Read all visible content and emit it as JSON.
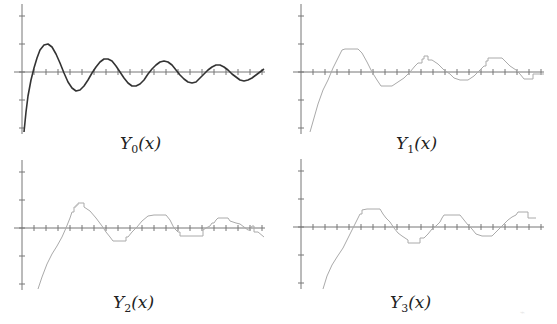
{
  "chart_data": [
    {
      "type": "line",
      "title": "Y_0(x)",
      "caption": {
        "base": "Y",
        "sub": "0",
        "arg": "(x)"
      },
      "style": "smooth",
      "color": "#333333",
      "axes": {
        "origin_px": [
          22,
          72
        ],
        "y_ticks_px": [
          16,
          44,
          72,
          100,
          128
        ],
        "x_tick_step_px": 12,
        "x_range_px": [
          14,
          265
        ],
        "y_range_px": [
          4,
          134
        ]
      },
      "grid": false,
      "points": [
        [
          24,
          132
        ],
        [
          26,
          112
        ],
        [
          28,
          96
        ],
        [
          31,
          80
        ],
        [
          34,
          68
        ],
        [
          37,
          58
        ],
        [
          40,
          50
        ],
        [
          44,
          45
        ],
        [
          48,
          44
        ],
        [
          52,
          47
        ],
        [
          56,
          54
        ],
        [
          60,
          63
        ],
        [
          64,
          73
        ],
        [
          68,
          82
        ],
        [
          72,
          88
        ],
        [
          76,
          91
        ],
        [
          80,
          90
        ],
        [
          84,
          86
        ],
        [
          88,
          80
        ],
        [
          92,
          73
        ],
        [
          96,
          67
        ],
        [
          100,
          62
        ],
        [
          104,
          59
        ],
        [
          108,
          59
        ],
        [
          112,
          61
        ],
        [
          116,
          66
        ],
        [
          120,
          72
        ],
        [
          124,
          78
        ],
        [
          128,
          83
        ],
        [
          132,
          86
        ],
        [
          136,
          86
        ],
        [
          140,
          84
        ],
        [
          144,
          80
        ],
        [
          148,
          74
        ],
        [
          152,
          69
        ],
        [
          156,
          65
        ],
        [
          160,
          62
        ],
        [
          164,
          61
        ],
        [
          168,
          62
        ],
        [
          172,
          65
        ],
        [
          176,
          70
        ],
        [
          180,
          75
        ],
        [
          184,
          79
        ],
        [
          188,
          82
        ],
        [
          192,
          83
        ],
        [
          196,
          82
        ],
        [
          200,
          78
        ],
        [
          204,
          74
        ],
        [
          208,
          70
        ],
        [
          212,
          67
        ],
        [
          216,
          65
        ],
        [
          220,
          65
        ],
        [
          224,
          67
        ],
        [
          228,
          70
        ],
        [
          232,
          74
        ],
        [
          236,
          77
        ],
        [
          240,
          80
        ],
        [
          244,
          81
        ],
        [
          248,
          80
        ],
        [
          252,
          78
        ],
        [
          256,
          75
        ],
        [
          260,
          72
        ],
        [
          264,
          69
        ]
      ]
    },
    {
      "type": "line",
      "title": "Y_1(x)",
      "caption": {
        "base": "Y",
        "sub": "1",
        "arg": "(x)"
      },
      "style": "stepped-approximation",
      "color": "#aaaaaa",
      "axes": {
        "origin_px": [
          301,
          72
        ],
        "y_ticks_px": [
          16,
          44,
          72,
          100,
          128
        ],
        "x_tick_step_px": 12,
        "x_range_px": [
          293,
          544
        ],
        "y_range_px": [
          4,
          134
        ]
      },
      "grid": false,
      "points": [
        [
          310,
          132
        ],
        [
          314,
          118
        ],
        [
          318,
          104
        ],
        [
          323,
          90
        ],
        [
          328,
          80
        ],
        [
          333,
          68
        ],
        [
          338,
          58
        ],
        [
          342,
          50
        ],
        [
          345,
          49
        ],
        [
          350,
          49
        ],
        [
          358,
          49
        ],
        [
          362,
          53
        ],
        [
          367,
          62
        ],
        [
          372,
          72
        ],
        [
          377,
          80
        ],
        [
          381,
          86
        ],
        [
          392,
          86
        ],
        [
          398,
          82
        ],
        [
          404,
          78
        ],
        [
          410,
          72
        ],
        [
          415,
          66
        ],
        [
          418,
          63
        ],
        [
          422,
          63
        ],
        [
          422,
          59
        ],
        [
          424,
          59
        ],
        [
          424,
          56
        ],
        [
          428,
          56
        ],
        [
          428,
          60
        ],
        [
          432,
          60
        ],
        [
          438,
          64
        ],
        [
          444,
          70
        ],
        [
          450,
          74
        ],
        [
          454,
          78
        ],
        [
          460,
          80
        ],
        [
          468,
          80
        ],
        [
          474,
          76
        ],
        [
          478,
          72
        ],
        [
          482,
          68
        ],
        [
          484,
          66
        ],
        [
          486,
          66
        ],
        [
          486,
          61
        ],
        [
          488,
          61
        ],
        [
          488,
          58
        ],
        [
          502,
          58
        ],
        [
          505,
          61
        ],
        [
          510,
          66
        ],
        [
          516,
          70
        ],
        [
          520,
          74
        ],
        [
          524,
          79
        ],
        [
          533,
          79
        ],
        [
          533,
          74
        ],
        [
          544,
          74
        ]
      ]
    },
    {
      "type": "line",
      "title": "Y_2(x)",
      "caption": {
        "base": "Y",
        "sub": "2",
        "arg": "(x)"
      },
      "style": "stepped-approximation",
      "color": "#aaaaaa",
      "axes": {
        "origin_px": [
          22,
          228
        ],
        "y_ticks_px": [
          172,
          200,
          228,
          256,
          284
        ],
        "x_tick_step_px": 12,
        "x_range_px": [
          14,
          265
        ],
        "y_range_px": [
          160,
          290
        ]
      },
      "grid": false,
      "points": [
        [
          38,
          289
        ],
        [
          42,
          277
        ],
        [
          47,
          264
        ],
        [
          52,
          254
        ],
        [
          57,
          246
        ],
        [
          62,
          237
        ],
        [
          66,
          228
        ],
        [
          70,
          218
        ],
        [
          72,
          212
        ],
        [
          74,
          212
        ],
        [
          74,
          207
        ],
        [
          76,
          207
        ],
        [
          76,
          205
        ],
        [
          78,
          205
        ],
        [
          78,
          203
        ],
        [
          84,
          203
        ],
        [
          84,
          207
        ],
        [
          90,
          211
        ],
        [
          96,
          218
        ],
        [
          102,
          226
        ],
        [
          106,
          232
        ],
        [
          110,
          237
        ],
        [
          113,
          241
        ],
        [
          126,
          241
        ],
        [
          126,
          237
        ],
        [
          128,
          237
        ],
        [
          132,
          232
        ],
        [
          137,
          227
        ],
        [
          142,
          221
        ],
        [
          148,
          216
        ],
        [
          154,
          215
        ],
        [
          166,
          215
        ],
        [
          170,
          220
        ],
        [
          174,
          228
        ],
        [
          178,
          232
        ],
        [
          180,
          232
        ],
        [
          180,
          236
        ],
        [
          203,
          236
        ],
        [
          203,
          230
        ],
        [
          206,
          228
        ],
        [
          210,
          226
        ],
        [
          212,
          223
        ],
        [
          214,
          223
        ],
        [
          216,
          220
        ],
        [
          218,
          218
        ],
        [
          228,
          218
        ],
        [
          230,
          221
        ],
        [
          236,
          223
        ],
        [
          240,
          224
        ],
        [
          244,
          227
        ],
        [
          248,
          230
        ],
        [
          250,
          230
        ],
        [
          252,
          226
        ],
        [
          254,
          226
        ],
        [
          254,
          232
        ],
        [
          258,
          232
        ],
        [
          264,
          237
        ]
      ]
    },
    {
      "type": "line",
      "title": "Y_3(x)",
      "caption": {
        "base": "Y",
        "sub": "3",
        "arg": "(x)"
      },
      "style": "stepped-approximation",
      "color": "#aaaaaa",
      "axes": {
        "origin_px": [
          301,
          227
        ],
        "y_ticks_px": [
          171,
          199,
          227,
          255,
          283
        ],
        "x_tick_step_px": 12,
        "x_range_px": [
          293,
          544
        ],
        "y_range_px": [
          159,
          289
        ]
      },
      "grid": false,
      "points": [
        [
          323,
          289
        ],
        [
          327,
          276
        ],
        [
          332,
          265
        ],
        [
          337,
          257
        ],
        [
          343,
          248
        ],
        [
          348,
          238
        ],
        [
          353,
          228
        ],
        [
          357,
          220
        ],
        [
          360,
          214
        ],
        [
          362,
          214
        ],
        [
          362,
          210
        ],
        [
          367,
          209
        ],
        [
          380,
          209
        ],
        [
          383,
          214
        ],
        [
          386,
          218
        ],
        [
          390,
          222
        ],
        [
          394,
          228
        ],
        [
          398,
          233
        ],
        [
          402,
          236
        ],
        [
          405,
          238
        ],
        [
          408,
          240
        ],
        [
          408,
          243
        ],
        [
          420,
          243
        ],
        [
          420,
          238
        ],
        [
          424,
          238
        ],
        [
          428,
          234
        ],
        [
          432,
          229
        ],
        [
          436,
          226
        ],
        [
          440,
          222
        ],
        [
          442,
          218
        ],
        [
          444,
          215
        ],
        [
          460,
          215
        ],
        [
          464,
          220
        ],
        [
          468,
          225
        ],
        [
          472,
          229
        ],
        [
          476,
          234
        ],
        [
          482,
          236
        ],
        [
          492,
          236
        ],
        [
          496,
          232
        ],
        [
          500,
          228
        ],
        [
          504,
          224
        ],
        [
          508,
          220
        ],
        [
          512,
          217
        ],
        [
          516,
          215
        ],
        [
          518,
          212
        ],
        [
          528,
          212
        ],
        [
          528,
          218
        ],
        [
          536,
          218
        ]
      ]
    }
  ],
  "footer_mark": "⌁"
}
